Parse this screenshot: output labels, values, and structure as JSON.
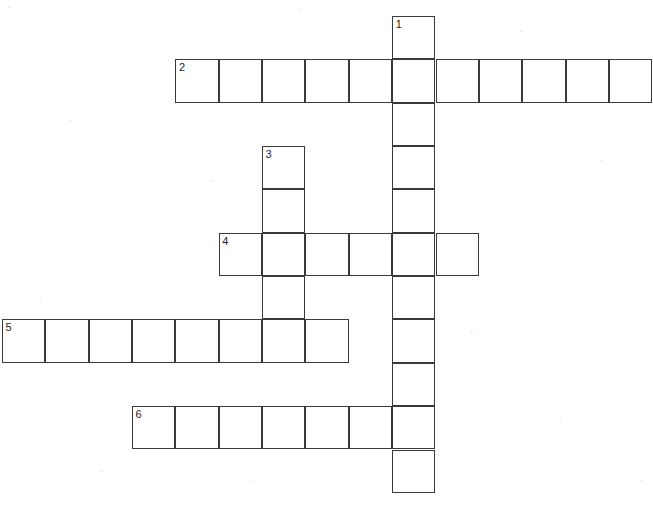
{
  "page": {
    "background_color": "#ffffff",
    "cell_fill_color": "#ffffff",
    "cell_border_color": "#3a3a3a",
    "number_color": "#1d1d1d",
    "width": 653,
    "height": 508
  },
  "grid": {
    "origin_x": 2,
    "origin_y": 16,
    "cell_size": 43.35,
    "columns": 15,
    "rows": 12,
    "border_width": 1.6
  },
  "chart_data": {
    "type": "table",
    "entries": [
      {
        "number": "1",
        "direction": "down",
        "length": 12,
        "start_col": 9,
        "start_row": 0
      },
      {
        "number": "2",
        "direction": "across",
        "length": 11,
        "start_col": 4,
        "start_row": 1
      },
      {
        "number": "3",
        "direction": "down",
        "length": 5,
        "start_col": 6,
        "start_row": 3
      },
      {
        "number": "4",
        "direction": "across",
        "length": 6,
        "start_col": 5,
        "start_row": 5
      },
      {
        "number": "5",
        "direction": "across",
        "length": 8,
        "start_col": 0,
        "start_row": 7
      },
      {
        "number": "6",
        "direction": "across",
        "length": 7,
        "start_col": 3,
        "start_row": 9
      }
    ],
    "cells": [
      {
        "col": 9,
        "row": 0,
        "number": "1"
      },
      {
        "col": 4,
        "row": 1,
        "number": "2"
      },
      {
        "col": 5,
        "row": 1,
        "number": ""
      },
      {
        "col": 6,
        "row": 1,
        "number": ""
      },
      {
        "col": 7,
        "row": 1,
        "number": ""
      },
      {
        "col": 8,
        "row": 1,
        "number": ""
      },
      {
        "col": 9,
        "row": 1,
        "number": ""
      },
      {
        "col": 10,
        "row": 1,
        "number": ""
      },
      {
        "col": 11,
        "row": 1,
        "number": ""
      },
      {
        "col": 12,
        "row": 1,
        "number": ""
      },
      {
        "col": 13,
        "row": 1,
        "number": ""
      },
      {
        "col": 14,
        "row": 1,
        "number": ""
      },
      {
        "col": 9,
        "row": 2,
        "number": ""
      },
      {
        "col": 6,
        "row": 3,
        "number": "3"
      },
      {
        "col": 9,
        "row": 3,
        "number": ""
      },
      {
        "col": 6,
        "row": 4,
        "number": ""
      },
      {
        "col": 9,
        "row": 4,
        "number": ""
      },
      {
        "col": 5,
        "row": 5,
        "number": "4"
      },
      {
        "col": 6,
        "row": 5,
        "number": ""
      },
      {
        "col": 7,
        "row": 5,
        "number": ""
      },
      {
        "col": 8,
        "row": 5,
        "number": ""
      },
      {
        "col": 9,
        "row": 5,
        "number": ""
      },
      {
        "col": 10,
        "row": 5,
        "number": ""
      },
      {
        "col": 6,
        "row": 6,
        "number": ""
      },
      {
        "col": 9,
        "row": 6,
        "number": ""
      },
      {
        "col": 0,
        "row": 7,
        "number": "5"
      },
      {
        "col": 1,
        "row": 7,
        "number": ""
      },
      {
        "col": 2,
        "row": 7,
        "number": ""
      },
      {
        "col": 3,
        "row": 7,
        "number": ""
      },
      {
        "col": 4,
        "row": 7,
        "number": ""
      },
      {
        "col": 5,
        "row": 7,
        "number": ""
      },
      {
        "col": 6,
        "row": 7,
        "number": ""
      },
      {
        "col": 7,
        "row": 7,
        "number": ""
      },
      {
        "col": 9,
        "row": 7,
        "number": ""
      },
      {
        "col": 9,
        "row": 8,
        "number": ""
      },
      {
        "col": 3,
        "row": 9,
        "number": "6"
      },
      {
        "col": 4,
        "row": 9,
        "number": ""
      },
      {
        "col": 5,
        "row": 9,
        "number": ""
      },
      {
        "col": 6,
        "row": 9,
        "number": ""
      },
      {
        "col": 7,
        "row": 9,
        "number": ""
      },
      {
        "col": 8,
        "row": 9,
        "number": ""
      },
      {
        "col": 9,
        "row": 9,
        "number": ""
      },
      {
        "col": 9,
        "row": 10,
        "number": ""
      }
    ]
  }
}
